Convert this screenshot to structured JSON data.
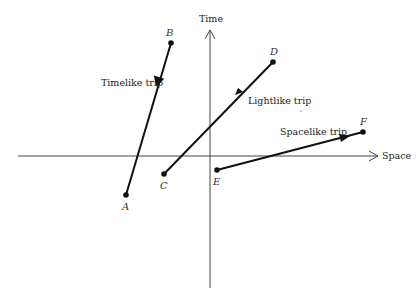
{
  "diagram": {
    "axes": {
      "time_label": "Time",
      "space_label": "Space"
    },
    "trips": [
      {
        "label": "Timelike trip",
        "start": "A",
        "end": "B"
      },
      {
        "label": "Lightlike trip",
        "start": "C",
        "end": "D"
      },
      {
        "label": "Spacelike trip",
        "start": "E",
        "end": "F"
      }
    ],
    "points": {
      "A": "A",
      "B": "B",
      "C": "C",
      "D": "D",
      "E": "E",
      "F": "F"
    },
    "colors": {
      "line": "#111111",
      "axis": "#444444"
    }
  }
}
